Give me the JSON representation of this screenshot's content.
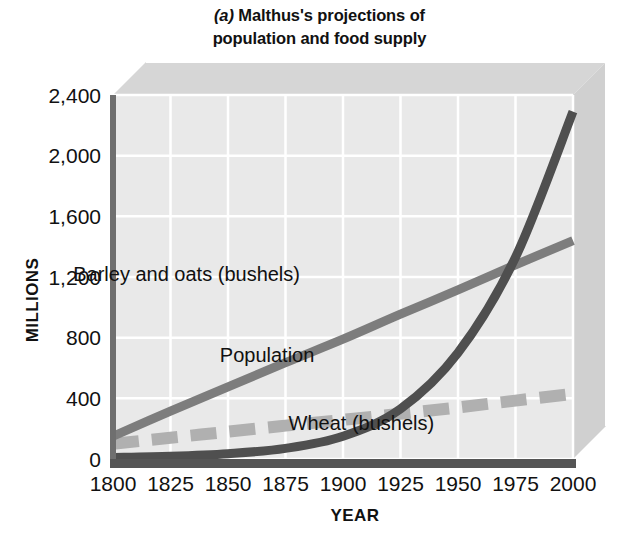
{
  "figure": {
    "panel_letter": "(a)",
    "title_line1": "Malthus's projections of",
    "title_line2": "population and food supply"
  },
  "chart_data": {
    "type": "line",
    "title": "(a) Malthus's projections of population and food supply",
    "xlabel": "YEAR",
    "ylabel": "MILLIONS",
    "xlim": [
      1800,
      2000
    ],
    "ylim": [
      0,
      2400
    ],
    "xticks": [
      "1800",
      "1825",
      "1850",
      "1875",
      "1900",
      "1925",
      "1950",
      "1975",
      "2000"
    ],
    "yticks": [
      "0",
      "400",
      "800",
      "1,200",
      "1,600",
      "2,000",
      "2,400"
    ],
    "xtick_values": [
      1800,
      1825,
      1850,
      1875,
      1900,
      1925,
      1950,
      1975,
      2000
    ],
    "ytick_values": [
      0,
      400,
      800,
      1200,
      1600,
      2000,
      2400
    ],
    "grid": true,
    "legend_position": "inline-annotations",
    "x": [
      1800,
      1825,
      1850,
      1875,
      1900,
      1925,
      1950,
      1975,
      2000
    ],
    "series": [
      {
        "name": "Population",
        "label": "Population",
        "style": "solid",
        "color": "#4f4f4f",
        "width": 9,
        "values": [
          10,
          18,
          35,
          70,
          150,
          330,
          700,
          1330,
          2290
        ],
        "label_x": 1867,
        "label_y": 640
      },
      {
        "name": "Barley and oats (bushels)",
        "label": "Barley and oats (bushels)",
        "style": "solid",
        "color": "#7d7d7d",
        "width": 9,
        "values": [
          150,
          315,
          475,
          635,
          790,
          955,
          1115,
          1280,
          1440
        ],
        "label_x": 1832,
        "label_y": 1175
      },
      {
        "name": "Wheat (bushels)",
        "label": "Wheat (bushels)",
        "style": "dashed",
        "color": "#b0b0b0",
        "width": 12,
        "values": [
          100,
          140,
          180,
          220,
          258,
          298,
          340,
          385,
          430
        ],
        "label_x": 1908,
        "label_y": 190
      }
    ],
    "colors": {
      "plot_background": "#e9e9e9",
      "gridline": "#ffffff",
      "axis_line": "#6f6f6f",
      "baseline": "#555555",
      "depth_top_face": "#d6d6d6",
      "depth_right_face": "#d0d0d0",
      "text": "#111111"
    }
  }
}
